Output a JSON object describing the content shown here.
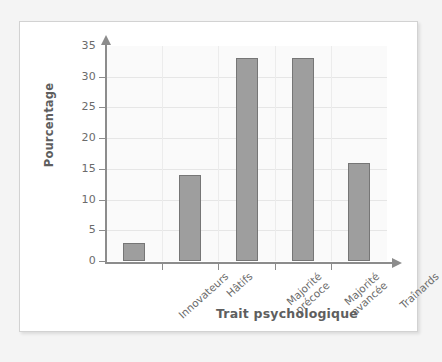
{
  "chart_data": {
    "type": "bar",
    "title": "",
    "xlabel": "Trait psychologique",
    "ylabel": "Pourcentage",
    "categories": [
      "Innovateurs",
      "Hâtifs",
      "Majorité précoce",
      "Majorité avancée",
      "Traînards"
    ],
    "category_lines": [
      [
        "Innovateurs"
      ],
      [
        "Hâtifs"
      ],
      [
        "Majorité",
        "précoce"
      ],
      [
        "Majorité",
        "avancée"
      ],
      [
        "Traînards"
      ]
    ],
    "values": [
      3,
      14,
      33,
      33,
      16
    ],
    "ylim": [
      0,
      35
    ],
    "ytick_values": [
      0,
      5,
      10,
      15,
      20,
      25,
      30,
      35
    ],
    "ytick_labels": [
      "0",
      "5",
      "10",
      "15",
      "20",
      "25",
      "30",
      "35"
    ],
    "grid": "both",
    "legend": "none",
    "bar_color": "#9e9e9e",
    "bar_border_color": "#767676",
    "axis_color": "#8c8c8c",
    "grid_color": "#e6e6e6",
    "text_color": "#6b6b6b",
    "title_color": "#5e5e5e",
    "plot_background": "#fafafa",
    "card_background": "#ffffff",
    "page_background": "#f4f4f4"
  }
}
